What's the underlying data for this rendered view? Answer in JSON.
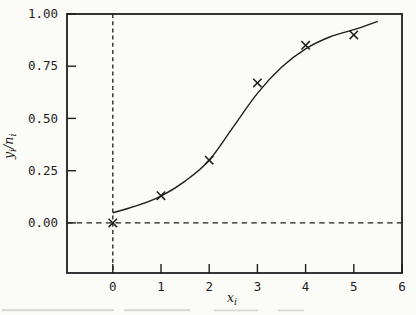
{
  "figure": {
    "background_color": "#fbfbf7",
    "ink_color": "#1e1e1e",
    "remnant_color": "#bdbdb6"
  },
  "chart_data": {
    "type": "scatter",
    "title": "",
    "xlabel": "x_i",
    "ylabel": "y_i/n_i",
    "xlabel_parts": {
      "base": "x",
      "sub": "i"
    },
    "ylabel_parts": {
      "numerator_base": "y",
      "numerator_sub": "i",
      "slash": "/",
      "denominator_base": "n",
      "denominator_sub": "i"
    },
    "xlim": [
      -0.95,
      6.0
    ],
    "ylim": [
      -0.24,
      1.0
    ],
    "grid": false,
    "legend_position": "none",
    "x_ticks": [
      {
        "v": 0,
        "label": "0"
      },
      {
        "v": 1,
        "label": "1"
      },
      {
        "v": 2,
        "label": "2"
      },
      {
        "v": 3,
        "label": "3"
      },
      {
        "v": 4,
        "label": "4"
      },
      {
        "v": 5,
        "label": "5"
      },
      {
        "v": 6,
        "label": "6"
      }
    ],
    "y_ticks": [
      {
        "v": 0.0,
        "label": "0.00"
      },
      {
        "v": 0.25,
        "label": "0.25"
      },
      {
        "v": 0.5,
        "label": "0.50"
      },
      {
        "v": 0.75,
        "label": "0.75"
      },
      {
        "v": 1.0,
        "label": "1.00"
      }
    ],
    "reference_lines": [
      {
        "orientation": "horizontal",
        "at": 0.0,
        "style": "dashed"
      },
      {
        "orientation": "vertical",
        "at": 0.0,
        "style": "dashed"
      }
    ],
    "series": [
      {
        "name": "observed-proportions",
        "type": "scatter",
        "marker": "x",
        "points": [
          [
            0,
            0.0
          ],
          [
            1,
            0.13
          ],
          [
            2,
            0.3
          ],
          [
            3,
            0.67
          ],
          [
            4,
            0.85
          ],
          [
            5,
            0.9
          ]
        ]
      },
      {
        "name": "fitted-sigmoid-curve",
        "type": "line",
        "points": [
          [
            0,
            0.048
          ],
          [
            0.5,
            0.082
          ],
          [
            1,
            0.128
          ],
          [
            1.5,
            0.2
          ],
          [
            2,
            0.3
          ],
          [
            2.5,
            0.46
          ],
          [
            3,
            0.62
          ],
          [
            3.5,
            0.745
          ],
          [
            4,
            0.833
          ],
          [
            4.5,
            0.89
          ],
          [
            5,
            0.925
          ],
          [
            5.5,
            0.965
          ]
        ]
      }
    ]
  }
}
